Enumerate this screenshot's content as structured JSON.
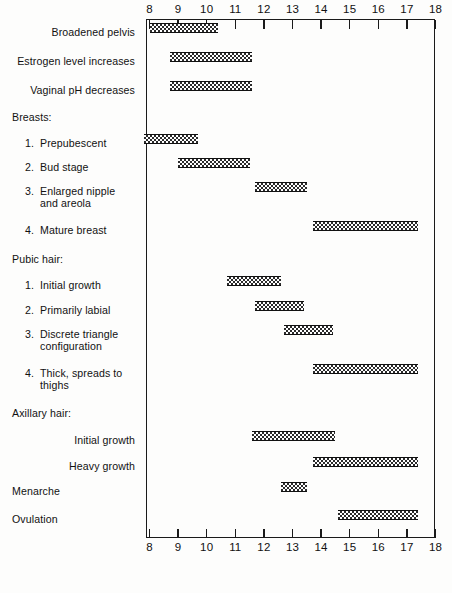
{
  "chart_data": {
    "type": "bar",
    "orientation": "horizontal-range",
    "title": "",
    "xlabel": "",
    "ylabel": "",
    "xlim": [
      8,
      18
    ],
    "grid": false,
    "legend": null,
    "axis_ticks": [
      "8",
      "9",
      "10",
      "11",
      "12",
      "13",
      "14",
      "15",
      "16",
      "17",
      "18"
    ],
    "axis_positions": "top and bottom",
    "categories": [
      "Broadened pelvis",
      "Estrogen level increases",
      "Vaginal pH decreases",
      "Breasts:",
      "1.  Prepubescent",
      "2.  Bud stage",
      "3.  Enlarged nipple and areola",
      "4.  Mature breast",
      "Pubic hair:",
      "1.  Initial growth",
      "2.  Primarily labial",
      "3.  Discrete triangle configuration",
      "4.  Thick, spreads to thighs",
      "Axillary hair:",
      "Initial growth",
      "Heavy growth",
      "Menarche",
      "Ovulation"
    ],
    "ranges": [
      [
        8.0,
        10.4
      ],
      [
        8.7,
        11.6
      ],
      [
        8.7,
        11.6
      ],
      null,
      [
        7.8,
        9.7
      ],
      [
        9.0,
        11.5
      ],
      [
        11.7,
        13.5
      ],
      [
        13.7,
        17.4
      ],
      null,
      [
        10.7,
        12.6
      ],
      [
        11.7,
        13.4
      ],
      [
        12.7,
        14.4
      ],
      [
        13.7,
        17.4
      ],
      null,
      [
        11.6,
        14.5
      ],
      [
        13.7,
        17.4
      ],
      [
        12.6,
        13.5
      ],
      [
        14.6,
        17.4
      ]
    ]
  },
  "axis": {
    "ticks": [
      {
        "value": 8,
        "label": "8"
      },
      {
        "value": 9,
        "label": "9"
      },
      {
        "value": 10,
        "label": "10"
      },
      {
        "value": 11,
        "label": "11"
      },
      {
        "value": 12,
        "label": "12"
      },
      {
        "value": 13,
        "label": "13"
      },
      {
        "value": 14,
        "label": "14"
      },
      {
        "value": 15,
        "label": "15"
      },
      {
        "value": 16,
        "label": "16"
      },
      {
        "value": 17,
        "label": "17"
      },
      {
        "value": 18,
        "label": "18"
      }
    ]
  },
  "rows": [
    {
      "id": "broadened-pelvis",
      "label": "Broadened pelvis",
      "style": "right",
      "num": "",
      "y": 32,
      "bar": [
        8.0,
        10.4
      ]
    },
    {
      "id": "estrogen-level",
      "label": "Estrogen level increases",
      "style": "right",
      "num": "",
      "y": 61,
      "bar": [
        8.7,
        11.6
      ]
    },
    {
      "id": "vaginal-ph",
      "label": "Vaginal pH decreases",
      "style": "right",
      "num": "",
      "y": 90,
      "bar": [
        8.7,
        11.6
      ]
    },
    {
      "id": "breasts-heading",
      "label": "Breasts:",
      "style": "left",
      "num": "",
      "y": 117,
      "bar": null
    },
    {
      "id": "breast-prepubescent",
      "label": "Prepubescent",
      "style": "num",
      "num": "1.",
      "y": 143,
      "bar": [
        7.8,
        9.7
      ]
    },
    {
      "id": "breast-bud-stage",
      "label": "Bud stage",
      "style": "num",
      "num": "2.",
      "y": 167,
      "bar": [
        9.0,
        11.5
      ]
    },
    {
      "id": "breast-enlarged-nipple",
      "label": "Enlarged nipple\nand areola",
      "style": "num",
      "num": "3.",
      "y": 191,
      "bar": [
        11.7,
        13.5
      ]
    },
    {
      "id": "breast-mature",
      "label": "Mature breast",
      "style": "num",
      "num": "4.",
      "y": 230,
      "bar": [
        13.7,
        17.4
      ]
    },
    {
      "id": "pubic-hair-heading",
      "label": "Pubic hair:",
      "style": "left",
      "num": "",
      "y": 259,
      "bar": null
    },
    {
      "id": "pubic-initial-growth",
      "label": "Initial growth",
      "style": "num",
      "num": "1.",
      "y": 285,
      "bar": [
        10.7,
        12.6
      ]
    },
    {
      "id": "pubic-primarily-labial",
      "label": "Primarily labial",
      "style": "num",
      "num": "2.",
      "y": 310,
      "bar": [
        11.7,
        13.4
      ]
    },
    {
      "id": "pubic-discrete-triangle",
      "label": "Discrete triangle\nconfiguration",
      "style": "num",
      "num": "3.",
      "y": 334,
      "bar": [
        12.7,
        14.4
      ]
    },
    {
      "id": "pubic-thick-spreads",
      "label": "Thick, spreads to\nthighs",
      "style": "num",
      "num": "4.",
      "y": 373,
      "bar": [
        13.7,
        17.4
      ]
    },
    {
      "id": "axillary-hair-heading",
      "label": "Axillary hair:",
      "style": "left",
      "num": "",
      "y": 413,
      "bar": null
    },
    {
      "id": "axillary-initial-growth",
      "label": "Initial growth",
      "style": "right",
      "num": "",
      "y": 440,
      "bar": [
        11.6,
        14.5
      ]
    },
    {
      "id": "axillary-heavy-growth",
      "label": "Heavy growth",
      "style": "right",
      "num": "",
      "y": 466,
      "bar": [
        13.7,
        17.4
      ]
    },
    {
      "id": "menarche",
      "label": "Menarche",
      "style": "left",
      "num": "",
      "y": 491,
      "bar": [
        12.6,
        13.5
      ]
    },
    {
      "id": "ovulation",
      "label": "Ovulation",
      "style": "left",
      "num": "",
      "y": 519,
      "bar": [
        14.6,
        17.4
      ]
    }
  ]
}
